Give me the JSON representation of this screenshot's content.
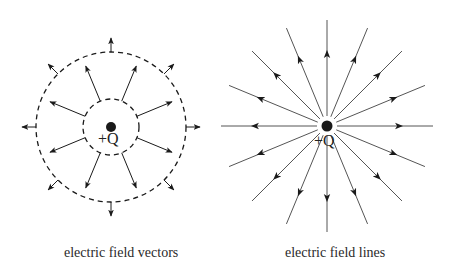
{
  "diagrams": [
    {
      "id": "vectors",
      "caption": "electric field vectors",
      "charge_label": "+Q",
      "center": [
        111,
        127
      ],
      "inner_radius": 28,
      "outer_radius": 75,
      "inner_vector_length": 38,
      "outer_vector_length": 14,
      "vector_count": 8,
      "vector_angles_deg": [
        22.5,
        67.5,
        112.5,
        157.5,
        202.5,
        247.5,
        292.5,
        337.5
      ],
      "outer_vector_angles_deg": [
        0,
        45,
        90,
        135,
        180,
        225,
        270,
        315
      ]
    },
    {
      "id": "lines",
      "caption": "electric field lines",
      "charge_label": "+Q",
      "center": [
        327,
        126
      ],
      "line_count": 16,
      "line_length": 106,
      "inner_gap": 10
    }
  ],
  "colors": {
    "ink": "#1a1a1a",
    "line": "#555555",
    "background": "#ffffff"
  }
}
